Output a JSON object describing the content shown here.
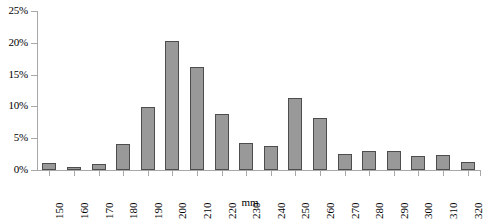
{
  "chart_data": {
    "type": "bar",
    "title": "",
    "xlabel": "mm",
    "ylabel": "",
    "ylim": [
      0,
      25
    ],
    "yticks": [
      0,
      5,
      10,
      15,
      20,
      25
    ],
    "ytick_labels": [
      "0%",
      "5%",
      "10%",
      "15%",
      "20%",
      "25%"
    ],
    "grid": false,
    "legend": false,
    "categories": [
      "150",
      "160",
      "170",
      "180",
      "190",
      "200",
      "210",
      "220",
      "230",
      "240",
      "250",
      "260",
      "270",
      "280",
      "290",
      "300",
      "310",
      "320"
    ],
    "values": [
      1.1,
      0.4,
      1.0,
      4.1,
      9.9,
      20.3,
      16.2,
      8.8,
      4.2,
      3.8,
      11.3,
      8.2,
      2.5,
      3.0,
      3.0,
      2.2,
      2.4,
      1.2
    ],
    "value_unit": "%",
    "bar_fill_color": "#999999",
    "bar_border_color": "#4d4d4d",
    "axis_color": "#a8a8a8",
    "background_color": "#ffffff"
  }
}
